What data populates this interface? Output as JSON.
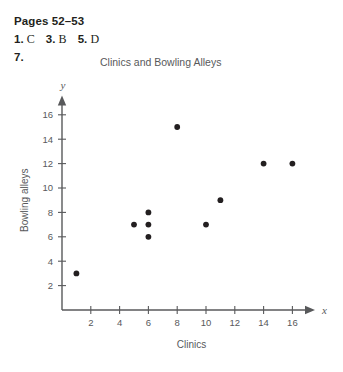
{
  "answer_key": {
    "pages_label": "Pages 52–53",
    "answers": [
      {
        "number": "1.",
        "value": "C"
      },
      {
        "number": "3.",
        "value": "B"
      },
      {
        "number": "5.",
        "value": "D"
      }
    ],
    "problem_number": "7."
  },
  "chart_data": {
    "type": "scatter",
    "title": "Clinics and Bowling Alleys",
    "xlabel": "Clinics",
    "ylabel": "Bowling alleys",
    "x_axis_variable": "x",
    "y_axis_variable": "y",
    "xlim": [
      0,
      17.5
    ],
    "ylim": [
      0,
      17.5
    ],
    "xticks": [
      2,
      4,
      6,
      8,
      10,
      12,
      14,
      16
    ],
    "yticks": [
      2,
      4,
      6,
      8,
      10,
      12,
      14,
      16
    ],
    "grid": false,
    "legend": false,
    "point_color": "#231f20",
    "axis_color": "#58595b",
    "points": [
      {
        "x": 1,
        "y": 3
      },
      {
        "x": 5,
        "y": 7
      },
      {
        "x": 6,
        "y": 8
      },
      {
        "x": 6,
        "y": 7
      },
      {
        "x": 6,
        "y": 6
      },
      {
        "x": 8,
        "y": 15
      },
      {
        "x": 10,
        "y": 7
      },
      {
        "x": 11,
        "y": 9
      },
      {
        "x": 14,
        "y": 12
      },
      {
        "x": 16,
        "y": 12
      }
    ]
  }
}
